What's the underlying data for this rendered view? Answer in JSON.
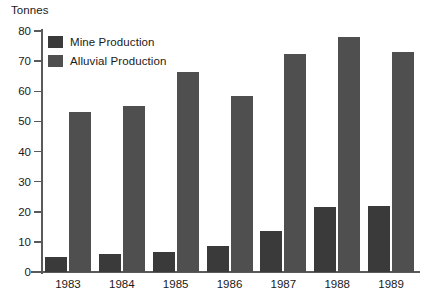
{
  "chart_data": {
    "type": "bar",
    "title": "",
    "subtitle": "",
    "xlabel": "",
    "ylabel": "Tonnes",
    "ylim": [
      0,
      80
    ],
    "yticks": [
      0,
      10,
      20,
      30,
      40,
      50,
      60,
      70,
      80
    ],
    "ytick_labels": [
      "0",
      "10",
      "20",
      "30",
      "40",
      "50",
      "60",
      "70",
      "80"
    ],
    "grid": false,
    "legend_position": "top-left",
    "categories": [
      "1983",
      "1984",
      "1985",
      "1986",
      "1987",
      "1988",
      "1989"
    ],
    "series": [
      {
        "name": "Mine Production",
        "color": "#3a3a3a",
        "values": [
          5,
          6,
          6.5,
          8.5,
          13.5,
          21.5,
          22
        ]
      },
      {
        "name": "Alluvial Production",
        "color": "#4f4f4f",
        "values": [
          53,
          55,
          66.5,
          58.5,
          72.5,
          78,
          73
        ]
      }
    ]
  },
  "axis": {
    "y_title": "Tonnes"
  },
  "legend": {
    "items": [
      {
        "label": "Mine Production",
        "swatch": "mine"
      },
      {
        "label": "Alluvial Production",
        "swatch": "alluvial"
      }
    ]
  }
}
